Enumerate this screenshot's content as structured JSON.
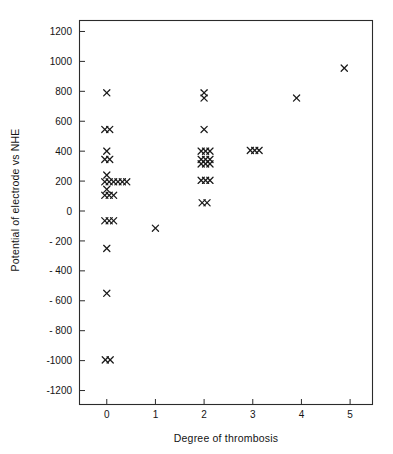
{
  "chart_data": {
    "type": "scatter",
    "title": "",
    "xlabel": "Degree of thrombosis",
    "ylabel": "Potential of electrode vs NHE",
    "marker": "x",
    "marker_color": "#1a1a1a",
    "grid": false,
    "legend": null,
    "xlim": [
      -0.55,
      5.45
    ],
    "ylim": [
      -1290,
      1270
    ],
    "xticks": [
      0,
      1,
      2,
      3,
      4,
      5
    ],
    "xtick_labels": [
      "0",
      "1",
      "2",
      "3",
      "4",
      "5"
    ],
    "yticks": [
      -1200,
      -1000,
      -800,
      -600,
      -400,
      -200,
      0,
      200,
      400,
      600,
      800,
      1000,
      1200
    ],
    "ytick_labels": [
      "-1200",
      "-1000",
      "- 800",
      "- 600",
      "- 400",
      "- 200",
      "0",
      "200",
      "400",
      "600",
      "800",
      "1000",
      "1200"
    ],
    "points": [
      {
        "x": 0.0,
        "y": 790
      },
      {
        "x": -0.04,
        "y": 545
      },
      {
        "x": 0.06,
        "y": 545
      },
      {
        "x": 0.0,
        "y": 400
      },
      {
        "x": -0.04,
        "y": 345
      },
      {
        "x": 0.06,
        "y": 345
      },
      {
        "x": 0.0,
        "y": 240
      },
      {
        "x": -0.04,
        "y": 195
      },
      {
        "x": 0.05,
        "y": 195
      },
      {
        "x": 0.14,
        "y": 195
      },
      {
        "x": 0.23,
        "y": 195
      },
      {
        "x": 0.32,
        "y": 195
      },
      {
        "x": 0.41,
        "y": 195
      },
      {
        "x": 0.0,
        "y": 145
      },
      {
        "x": -0.04,
        "y": 105
      },
      {
        "x": 0.05,
        "y": 105
      },
      {
        "x": 0.14,
        "y": 105
      },
      {
        "x": -0.04,
        "y": -65
      },
      {
        "x": 0.05,
        "y": -65
      },
      {
        "x": 0.14,
        "y": -65
      },
      {
        "x": 0.0,
        "y": -250
      },
      {
        "x": 0.0,
        "y": -550
      },
      {
        "x": -0.03,
        "y": -995
      },
      {
        "x": 0.07,
        "y": -995
      },
      {
        "x": 1.0,
        "y": -115
      },
      {
        "x": 2.0,
        "y": 790
      },
      {
        "x": 2.0,
        "y": 755
      },
      {
        "x": 2.0,
        "y": 545
      },
      {
        "x": 1.94,
        "y": 400
      },
      {
        "x": 2.03,
        "y": 400
      },
      {
        "x": 2.12,
        "y": 400
      },
      {
        "x": 1.94,
        "y": 345
      },
      {
        "x": 2.03,
        "y": 345
      },
      {
        "x": 2.12,
        "y": 345
      },
      {
        "x": 1.94,
        "y": 315
      },
      {
        "x": 2.03,
        "y": 315
      },
      {
        "x": 2.12,
        "y": 315
      },
      {
        "x": 1.94,
        "y": 205
      },
      {
        "x": 2.03,
        "y": 205
      },
      {
        "x": 2.12,
        "y": 205
      },
      {
        "x": 1.96,
        "y": 55
      },
      {
        "x": 2.06,
        "y": 55
      },
      {
        "x": 2.95,
        "y": 405
      },
      {
        "x": 3.04,
        "y": 405
      },
      {
        "x": 3.13,
        "y": 405
      },
      {
        "x": 3.9,
        "y": 755
      },
      {
        "x": 4.88,
        "y": 955
      }
    ],
    "series_summary": [
      {
        "degree": 0,
        "count": 24
      },
      {
        "degree": 1,
        "count": 1
      },
      {
        "degree": 2,
        "count": 17
      },
      {
        "degree": 3,
        "count": 3
      },
      {
        "degree": 4,
        "count": 1
      },
      {
        "degree": 5,
        "count": 1
      }
    ]
  }
}
